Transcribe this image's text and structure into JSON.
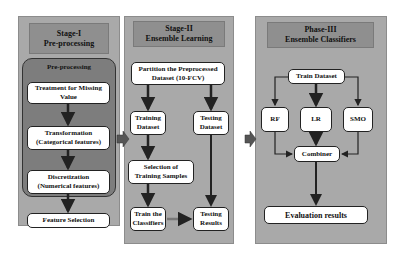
{
  "stage1": {
    "title_line1": "Stage-I",
    "title_line2": "Pre-processing",
    "group_title": "Pre-processing",
    "steps": [
      {
        "line1": "Treatment for Missing",
        "line2": "Value"
      },
      {
        "line1": "Transformation",
        "line2": "(Categorical features)"
      },
      {
        "line1": "Discretization",
        "line2": "(Numerical features)"
      }
    ],
    "feature_selection": "Feature Selection"
  },
  "stage2": {
    "title_line1": "Stage-II",
    "title_line2": "Ensemble Learning",
    "partition_line1": "Partition the Preprocessed",
    "partition_line2": "Dataset (10-FCV)",
    "training_line1": "Training",
    "training_line2": "Dataset",
    "testing_line1": "Testing",
    "testing_line2": "Dataset",
    "selection_line1": "Selection of",
    "selection_line2": "Training Samples",
    "train_line1": "Train the",
    "train_line2": "Classifiers",
    "results_line1": "Testing",
    "results_line2": "Results"
  },
  "stage3": {
    "title_line1": "Phase-III",
    "title_line2": "Ensemble Classifiers",
    "train_dataset": "Train Dataset",
    "classifiers": [
      "RF",
      "LR",
      "SMO"
    ],
    "combiner": "Combiner",
    "evaluation": "Evaluation results"
  }
}
